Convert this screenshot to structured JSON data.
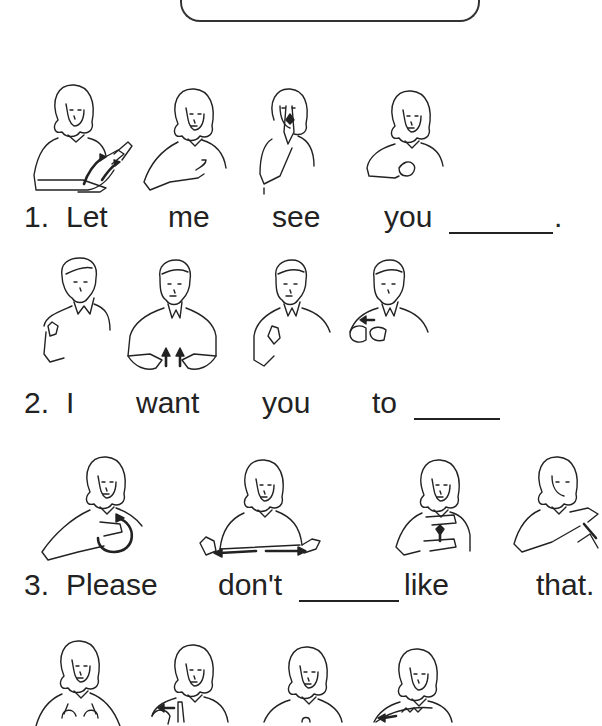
{
  "page": {
    "type": "sign language worksheet",
    "title_box": ""
  },
  "sentences": [
    {
      "number": "1.",
      "words": [
        "Let",
        "me",
        "see",
        "you"
      ],
      "blank": "_______",
      "ending": ".",
      "figure": "woman",
      "signs": [
        "let",
        "me",
        "see",
        "you"
      ]
    },
    {
      "number": "2.",
      "words": [
        "I",
        "want",
        "you",
        "to"
      ],
      "blank": "______",
      "ending": "",
      "figure": "man",
      "signs": [
        "I",
        "want",
        "you",
        "to"
      ]
    },
    {
      "number": "3.",
      "words": [
        "Please",
        "don't",
        "like",
        "that."
      ],
      "blank": "_______",
      "ending": "",
      "figure": "woman",
      "signs": [
        "please",
        "don't",
        "like",
        "that"
      ]
    },
    {
      "number": "",
      "words": [],
      "figure": "woman",
      "signs": [
        "sign-1",
        "sign-2",
        "sign-3",
        "sign-4"
      ]
    }
  ]
}
